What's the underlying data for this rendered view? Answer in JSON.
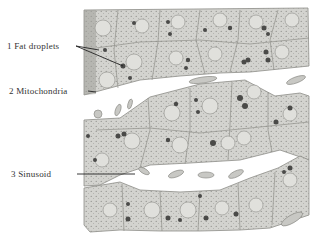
{
  "figure": {
    "colors": {
      "background": "#ffffff",
      "cytoplasm": "#d6d6d2",
      "membrane": "#9a9a95",
      "nucleus": "#e2e2de",
      "droplet": "#555555",
      "label_text": "#333333",
      "pointer": "#222222"
    }
  },
  "labels": [
    {
      "number": "1",
      "text": "1 Fat droplets"
    },
    {
      "number": "2",
      "text": "2 Mitochondria"
    },
    {
      "number": "3",
      "text": "3 Sinusoid"
    }
  ]
}
